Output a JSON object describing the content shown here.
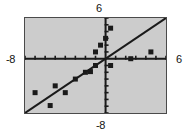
{
  "figure": {
    "type": "graphing-calculator-scatter-plot",
    "background_color": "#ffffff",
    "plot_background_color": "#cccccc",
    "ink_color": "#1a1a1a",
    "border_color": "#4a4a4a"
  },
  "labels": {
    "top": "6",
    "bottom": "-8",
    "left": "-8",
    "right": "6"
  },
  "chart_data": {
    "type": "scatter",
    "title": "",
    "xlabel": "",
    "ylabel": "",
    "xlim": [
      -8,
      6
    ],
    "ylim": [
      -8,
      6
    ],
    "xtick_step": 1,
    "ytick_step": 1,
    "grid": false,
    "legend": false,
    "axis_labels_shown": {
      "xmin": "-8",
      "xmax": "6",
      "ymin": "-8",
      "ymax": "6"
    },
    "points": [
      {
        "x": -7.0,
        "y": -5.0
      },
      {
        "x": -5.5,
        "y": -6.9
      },
      {
        "x": -5.0,
        "y": -4.0
      },
      {
        "x": -4.0,
        "y": -5.0
      },
      {
        "x": -3.0,
        "y": -3.0
      },
      {
        "x": -2.0,
        "y": -2.0
      },
      {
        "x": -1.5,
        "y": -1.9
      },
      {
        "x": -1.0,
        "y": -1.0
      },
      {
        "x": -1.0,
        "y": 1.0
      },
      {
        "x": -0.5,
        "y": 2.0
      },
      {
        "x": 0.0,
        "y": 3.0
      },
      {
        "x": 0.5,
        "y": 4.5
      },
      {
        "x": 0.5,
        "y": -1.0
      },
      {
        "x": 2.5,
        "y": 0.0
      },
      {
        "x": 4.5,
        "y": 1.0
      }
    ],
    "regression_line": {
      "slope": 1.0,
      "intercept": 0.0,
      "drawn_from": {
        "x": -8,
        "y": -8
      },
      "drawn_to": {
        "x": 6,
        "y": 6
      }
    }
  }
}
